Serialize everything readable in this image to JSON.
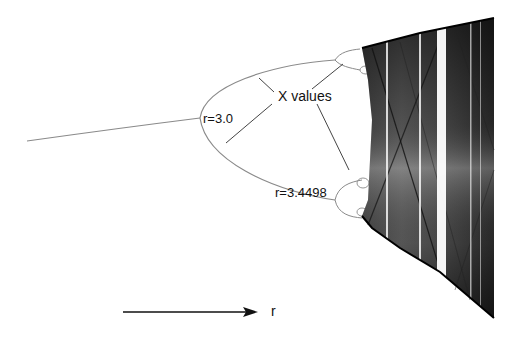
{
  "diagram": {
    "labels": {
      "y_axis_annotation": "X values",
      "first_bifurcation": "r=3.0",
      "second_bifurcation": "r=3.4498",
      "x_axis_arrow_label": "r"
    },
    "colors": {
      "background": "#ffffff",
      "curve": "#8a8a8a",
      "chaos_dark": "#111111",
      "pointer_lines": "#444444",
      "text": "#111111"
    }
  }
}
